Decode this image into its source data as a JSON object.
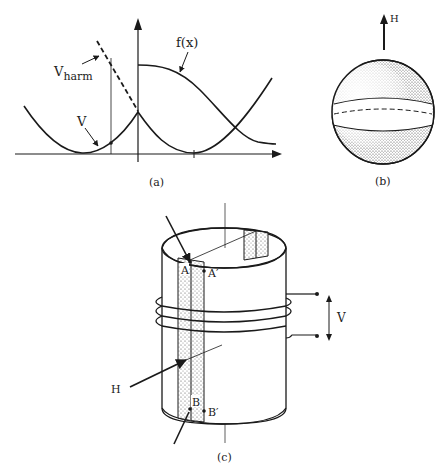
{
  "panel_a": {
    "caption": "(a)",
    "label_f": "f(x)",
    "label_vharm_main": "V",
    "label_vharm_sub": "harm",
    "label_v": "V"
  },
  "panel_b": {
    "caption": "(b)",
    "label_h": "H"
  },
  "panel_c": {
    "caption": "(c)",
    "label_a": "A",
    "label_a_prime": "A′",
    "label_b": "B",
    "label_b_prime": "B′",
    "label_h": "H",
    "label_v": "V"
  },
  "colors": {
    "ink": "#1a1a1a",
    "stipple": "#bcbcbc"
  }
}
